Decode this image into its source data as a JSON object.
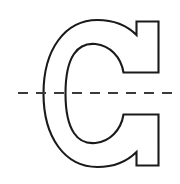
{
  "figure": {
    "background_color": "#ffffff",
    "width": 180,
    "height": 184,
    "glyph": {
      "character": "C",
      "style": "outline",
      "outline_color": "#1a1a1a",
      "fill_color": "#ffffff",
      "stroke_width": 2.1,
      "bounds": {
        "x": 43,
        "y": 20,
        "width": 117,
        "height": 147
      },
      "stem_thickness": 22,
      "terminal_cut": "flat-vertical"
    },
    "centerline": {
      "orientation": "horizontal",
      "style": "dashed",
      "color": "#3a3a3a",
      "stroke_width": 2,
      "y": 93,
      "x_start": 18,
      "x_end": 176,
      "dash_length": 10,
      "gap_length": 8
    }
  }
}
